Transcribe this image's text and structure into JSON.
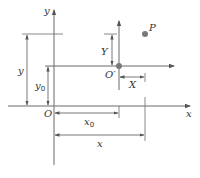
{
  "diagram": {
    "type": "coordinate-translation",
    "colors": {
      "line": "#6b6b6b",
      "text": "#333333",
      "point": "#7a7a7a"
    },
    "labels": {
      "main_y_axis": "y",
      "main_x_axis": "x",
      "origin": "O",
      "shifted_origin": "O′",
      "point": "P",
      "Y": "Y",
      "X": "X",
      "y_dim": "y",
      "y0_dim": "y",
      "y0_sub": "0",
      "x0_dim": "x",
      "x0_sub": "0",
      "x_dim": "x"
    }
  }
}
